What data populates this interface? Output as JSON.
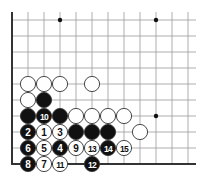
{
  "board": {
    "columns": 12,
    "rows": 10,
    "origin_x": 12,
    "origin_y": 20,
    "spacing": 16,
    "left_edge": true,
    "bottom_edge": true,
    "line_color": "#999999",
    "edge_color": "#333333",
    "hoshi": [
      [
        3,
        0
      ],
      [
        9,
        0
      ],
      [
        9,
        6
      ]
    ]
  },
  "stones": [
    {
      "col": 1,
      "row": 4,
      "color": "white",
      "label": ""
    },
    {
      "col": 2,
      "row": 4,
      "color": "white",
      "label": ""
    },
    {
      "col": 3,
      "row": 4,
      "color": "white",
      "label": ""
    },
    {
      "col": 5,
      "row": 4,
      "color": "white",
      "label": ""
    },
    {
      "col": 1,
      "row": 5,
      "color": "white",
      "label": ""
    },
    {
      "col": 2,
      "row": 5,
      "color": "black",
      "label": ""
    },
    {
      "col": 1,
      "row": 6,
      "color": "black",
      "label": ""
    },
    {
      "col": 2,
      "row": 6,
      "color": "black",
      "label": "10"
    },
    {
      "col": 3,
      "row": 6,
      "color": "black",
      "label": ""
    },
    {
      "col": 4,
      "row": 6,
      "color": "white",
      "label": ""
    },
    {
      "col": 5,
      "row": 6,
      "color": "white",
      "label": ""
    },
    {
      "col": 6,
      "row": 6,
      "color": "white",
      "label": ""
    },
    {
      "col": 7,
      "row": 6,
      "color": "white",
      "label": ""
    },
    {
      "col": 1,
      "row": 7,
      "color": "black",
      "label": "2"
    },
    {
      "col": 2,
      "row": 7,
      "color": "white",
      "label": "1"
    },
    {
      "col": 3,
      "row": 7,
      "color": "white",
      "label": "3"
    },
    {
      "col": 4,
      "row": 7,
      "color": "black",
      "label": ""
    },
    {
      "col": 5,
      "row": 7,
      "color": "black",
      "label": ""
    },
    {
      "col": 6,
      "row": 7,
      "color": "black",
      "label": ""
    },
    {
      "col": 8,
      "row": 7,
      "color": "white",
      "label": ""
    },
    {
      "col": 1,
      "row": 8,
      "color": "black",
      "label": "6"
    },
    {
      "col": 2,
      "row": 8,
      "color": "white",
      "label": "5"
    },
    {
      "col": 3,
      "row": 8,
      "color": "black",
      "label": "4"
    },
    {
      "col": 4,
      "row": 8,
      "color": "white",
      "label": "9"
    },
    {
      "col": 5,
      "row": 8,
      "color": "white",
      "label": "13"
    },
    {
      "col": 6,
      "row": 8,
      "color": "black",
      "label": "14"
    },
    {
      "col": 7,
      "row": 8,
      "color": "white",
      "label": "15"
    },
    {
      "col": 1,
      "row": 9,
      "color": "black",
      "label": "8"
    },
    {
      "col": 2,
      "row": 9,
      "color": "white",
      "label": "7"
    },
    {
      "col": 3,
      "row": 9,
      "color": "white",
      "label": "11"
    },
    {
      "col": 5,
      "row": 9,
      "color": "black",
      "label": "12"
    }
  ]
}
